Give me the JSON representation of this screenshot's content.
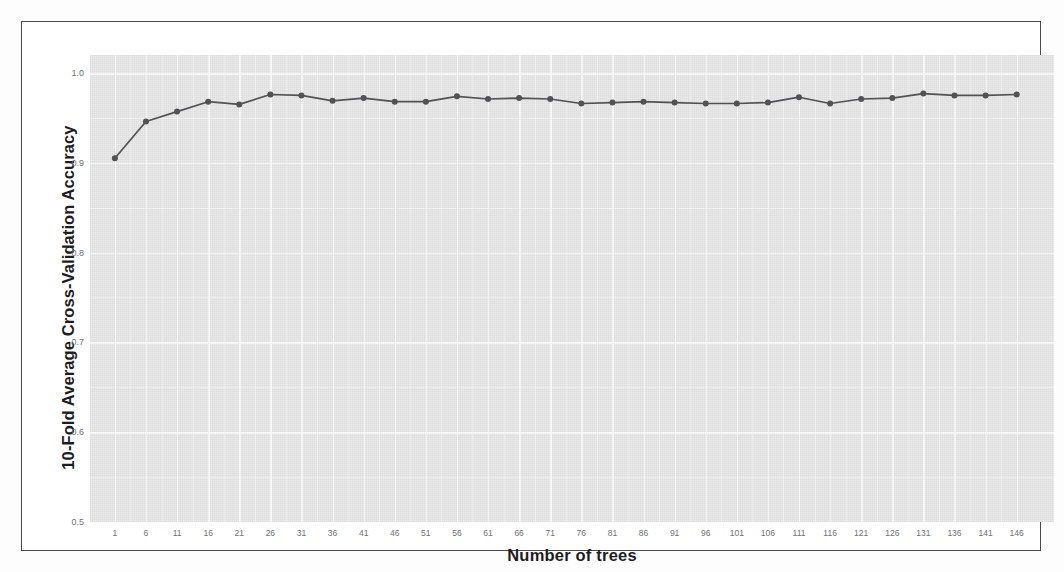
{
  "figure": {
    "background_color": "#ffffff",
    "panel_color": "#ebebeb",
    "grid_color": "#ffffff",
    "frame_color": "#4a4a4c",
    "series_color": "#555558"
  },
  "chart_data": {
    "type": "line",
    "title": "",
    "subtitle": "",
    "xlabel": "Number of trees",
    "ylabel": "10-Fold Average Cross-Validation Accuracy",
    "xlim": [
      -3,
      152
    ],
    "ylim": [
      0.5,
      1.02
    ],
    "grid": true,
    "legend": false,
    "legend_position": "none",
    "marker": "circle",
    "x_tick_labels": [
      "1",
      "6",
      "11",
      "16",
      "21",
      "26",
      "31",
      "36",
      "41",
      "46",
      "51",
      "56",
      "61",
      "66",
      "71",
      "76",
      "81",
      "86",
      "91",
      "96",
      "101",
      "106",
      "111",
      "116",
      "121",
      "126",
      "131",
      "136",
      "141",
      "146"
    ],
    "y_tick_labels": [
      "1.0",
      "0.9",
      "0.8",
      "0.7",
      "0.6",
      "0.5"
    ],
    "y_ticks": [
      1.0,
      0.9,
      0.8,
      0.7,
      0.6,
      0.5
    ],
    "y_minor_ticks": [
      0.95,
      0.85,
      0.75,
      0.65,
      0.55
    ],
    "x": [
      1,
      6,
      11,
      16,
      21,
      26,
      31,
      36,
      41,
      46,
      51,
      56,
      61,
      66,
      71,
      76,
      81,
      86,
      91,
      96,
      101,
      106,
      111,
      116,
      121,
      126,
      131,
      136,
      141,
      146
    ],
    "values": [
      0.905,
      0.946,
      0.957,
      0.968,
      0.965,
      0.976,
      0.975,
      0.969,
      0.972,
      0.968,
      0.968,
      0.974,
      0.971,
      0.972,
      0.971,
      0.966,
      0.967,
      0.968,
      0.967,
      0.966,
      0.966,
      0.967,
      0.973,
      0.966,
      0.971,
      0.972,
      0.977,
      0.975,
      0.975,
      0.976
    ],
    "series": [
      {
        "name": "10-fold CV accuracy",
        "values": [
          0.905,
          0.946,
          0.957,
          0.968,
          0.965,
          0.976,
          0.975,
          0.969,
          0.972,
          0.968,
          0.968,
          0.974,
          0.971,
          0.972,
          0.971,
          0.966,
          0.967,
          0.968,
          0.967,
          0.966,
          0.966,
          0.967,
          0.973,
          0.966,
          0.971,
          0.972,
          0.977,
          0.975,
          0.975,
          0.976
        ]
      }
    ]
  }
}
